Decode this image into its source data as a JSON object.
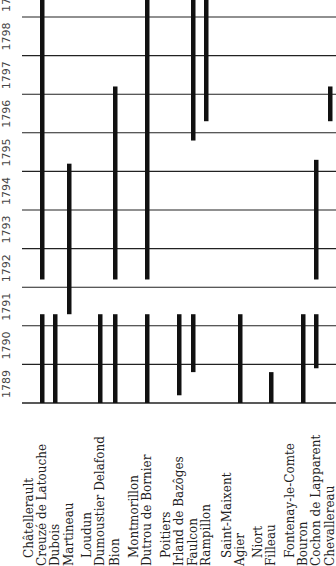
{
  "chart_data": {
    "type": "timeline",
    "orientation": "rotated-90",
    "year_ticks": [
      "1789",
      "1790",
      "1791",
      "1792",
      "1793",
      "1794",
      "1795",
      "1796",
      "1797",
      "1798",
      "1799"
    ],
    "rows": [
      {
        "label": "Châtellerault",
        "x": 0,
        "header": true
      },
      {
        "label": "Creuzé de Latouche",
        "x": 42,
        "segments": [
          [
            1789,
            1791.3
          ],
          [
            1792.2,
            1800
          ]
        ]
      },
      {
        "label": "Dubois",
        "x": 55,
        "segments": [
          [
            1789,
            1791.3
          ]
        ]
      },
      {
        "label": "Martineau",
        "x": 69,
        "segments": [
          [
            1791.3,
            1795.2
          ]
        ]
      },
      {
        "label": "Loudun",
        "x": 0,
        "header": true
      },
      {
        "label": "Dumoustier Delafond",
        "x": 100,
        "segments": [
          [
            1789,
            1791.3
          ]
        ]
      },
      {
        "label": "Bion",
        "x": 115,
        "segments": [
          [
            1789,
            1791.3
          ],
          [
            1792.2,
            1797.2
          ]
        ]
      },
      {
        "label": "Montmorillon",
        "x": 0,
        "header": true
      },
      {
        "label": "Dutrou de Bornier",
        "x": 147,
        "segments": [
          [
            1789,
            1791.3
          ],
          [
            1792.2,
            1800
          ]
        ]
      },
      {
        "label": "Poitiers",
        "x": 0,
        "header": true
      },
      {
        "label": "Irland de Bazôges",
        "x": 179,
        "segments": [
          [
            1789.2,
            1791.3
          ]
        ]
      },
      {
        "label": "Faulcon",
        "x": 193,
        "segments": [
          [
            1789.8,
            1791.3
          ],
          [
            1795.8,
            1800
          ]
        ]
      },
      {
        "label": "Rampillon",
        "x": 206,
        "segments": [
          [
            1796.3,
            1800
          ]
        ]
      },
      {
        "label": "Saint-Maixent",
        "x": 0,
        "header": true
      },
      {
        "label": "Agier",
        "x": 240,
        "segments": [
          [
            1789,
            1791.3
          ]
        ]
      },
      {
        "label": "Niort",
        "x": 0,
        "header": true
      },
      {
        "label": "Filleau",
        "x": 271,
        "segments": [
          [
            1789,
            1789.8
          ]
        ]
      },
      {
        "label": "Fontenay-le-Comte",
        "x": 0,
        "header": true
      },
      {
        "label": "Bouron",
        "x": 303,
        "segments": [
          [
            1789,
            1791.3
          ]
        ]
      },
      {
        "label": "Cochon de Lapparent",
        "x": 316,
        "segments": [
          [
            1789.9,
            1791.3
          ],
          [
            1792.2,
            1795.3
          ]
        ]
      },
      {
        "label": "Chevallereau",
        "x": 330,
        "segments": [
          [
            1796.3,
            1797.2
          ]
        ]
      }
    ],
    "grid": true,
    "xlabel": "",
    "ylabel": ""
  }
}
